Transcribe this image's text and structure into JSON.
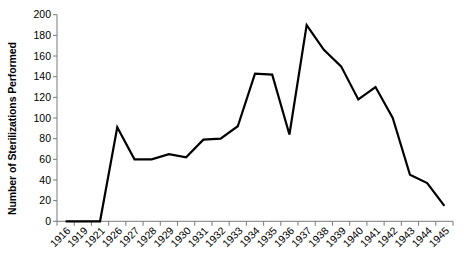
{
  "chart_data": {
    "type": "line",
    "title": "",
    "xlabel": "",
    "ylabel": "Number of Sterilizations Performed",
    "categories": [
      "1916",
      "1919",
      "1921",
      "1926",
      "1927",
      "1928",
      "1929",
      "1930",
      "1931",
      "1932",
      "1933",
      "1934",
      "1935",
      "1936",
      "1937",
      "1938",
      "1939",
      "1940",
      "1941",
      "1942",
      "1943",
      "1944",
      "1945"
    ],
    "values": [
      0,
      0,
      0,
      91,
      60,
      60,
      65,
      62,
      79,
      80,
      92,
      143,
      142,
      84,
      190,
      166,
      150,
      118,
      130,
      100,
      45,
      37,
      15
    ],
    "ylim": [
      0,
      200
    ],
    "yticks": [
      0,
      20,
      40,
      60,
      80,
      100,
      120,
      140,
      160,
      180,
      200
    ],
    "ytick_labels": [
      "0",
      "20",
      "40",
      "60",
      "80",
      "100",
      "120",
      "140",
      "160",
      "180",
      "200"
    ],
    "grid": false,
    "legend": "none",
    "line_color": "#000000",
    "axis_color": "#7a7a7a",
    "background": "#ffffff"
  }
}
